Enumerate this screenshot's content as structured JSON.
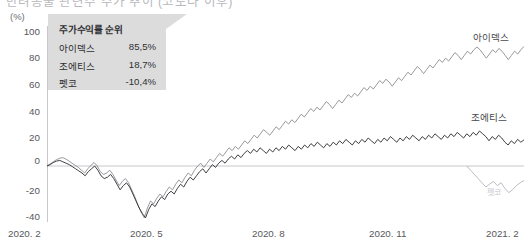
{
  "header": {
    "cut_off_title": "반려동물 관련주 주가 추이 (코로나 이후)"
  },
  "axis": {
    "unit_label": "(%)",
    "y_ticks": [
      "100",
      "80",
      "60",
      "40",
      "20",
      "0",
      "-20",
      "-40"
    ],
    "x_ticks": [
      "2020. 2",
      "2020. 5",
      "2020. 8",
      "2020. 11",
      "2021. 2"
    ]
  },
  "callout": {
    "title": "주가수익률 순위",
    "rows": [
      {
        "name": "아이덱스",
        "value": "85,5%"
      },
      {
        "name": "조에티스",
        "value": "18,7%"
      },
      {
        "name": "펫코",
        "value": "-10,4%"
      }
    ]
  },
  "series_labels": {
    "idexx": "아이덱스",
    "zoetis": "조에티스",
    "petco": "펫코"
  },
  "colors": {
    "idexx_line": "#8d8d93",
    "zoetis_line": "#2b2b30",
    "petco_line": "#b4b4ba",
    "zero_line": "#c8c8cc",
    "axis_line": "#c8c8cc",
    "callout_bg": "#dcdcdc",
    "tick_text": "#58585c"
  },
  "chart_data": {
    "type": "line",
    "xlabel": "",
    "ylabel": "(%)",
    "ylim": [
      -40,
      100
    ],
    "xlim": [
      "2020-02",
      "2021-02"
    ],
    "grid": false,
    "legend_position": "right-inline",
    "x_tick_labels": [
      "2020. 2",
      "2020. 5",
      "2020. 8",
      "2020. 11",
      "2021. 2"
    ],
    "y_tick_values": [
      100,
      80,
      60,
      40,
      20,
      0,
      -20,
      -40
    ],
    "zero_reference_line": 0,
    "annotations": [
      {
        "text": "주가수익률 순위",
        "type": "callout-title"
      },
      {
        "text": "아이덱스 85,5%",
        "type": "callout-row"
      },
      {
        "text": "조에티스 18,7%",
        "type": "callout-row"
      },
      {
        "text": "펫코 -10,4%",
        "type": "callout-row"
      }
    ],
    "series": [
      {
        "name": "아이덱스",
        "color": "#8d8d93",
        "final_value": 85.5,
        "values": [
          0,
          1.5,
          3,
          4.5,
          5.5,
          6,
          5,
          3.5,
          2,
          0.5,
          -1,
          -3,
          -5,
          -2,
          0.5,
          2.5,
          0,
          -4,
          -6,
          -5,
          -3,
          -6,
          -10,
          -14,
          -11,
          -9,
          -12,
          -17,
          -22,
          -28,
          -33,
          -37,
          -30,
          -25,
          -27,
          -23,
          -20,
          -22,
          -18,
          -15,
          -17,
          -13,
          -10,
          -12,
          -8,
          -5,
          -7,
          -3,
          0,
          2,
          -1,
          2,
          5,
          3,
          6,
          9,
          7,
          10,
          13,
          11,
          14,
          12,
          15,
          18,
          16,
          19,
          22,
          20,
          23,
          26,
          24,
          22,
          25,
          28,
          26,
          29,
          32,
          30,
          33,
          31,
          34,
          37,
          35,
          38,
          41,
          39,
          42,
          40,
          43,
          46,
          44,
          41,
          44,
          47,
          45,
          48,
          51,
          49,
          52,
          50,
          53,
          56,
          54,
          57,
          55,
          58,
          61,
          59,
          62,
          60,
          57,
          60,
          63,
          61,
          64,
          67,
          65,
          68,
          71,
          69,
          66,
          69,
          72,
          70,
          73,
          76,
          74,
          77,
          75,
          78,
          81,
          79,
          76,
          79,
          82,
          80,
          83,
          85,
          83,
          80,
          77,
          80,
          83,
          81,
          84,
          82,
          79,
          76,
          79,
          82,
          80,
          83,
          85.5
        ]
      },
      {
        "name": "조에티스",
        "color": "#2b2b30",
        "final_value": 18.7,
        "values": [
          0,
          1,
          2.5,
          3.5,
          4,
          3,
          2,
          1,
          -0.5,
          -2,
          -3.5,
          -5,
          -7,
          -4,
          -2,
          0,
          -3,
          -7,
          -9,
          -8,
          -6,
          -9,
          -13,
          -17,
          -14,
          -12,
          -15,
          -20,
          -25,
          -30,
          -34,
          -37,
          -31,
          -27,
          -29,
          -25,
          -22,
          -24,
          -20,
          -18,
          -20,
          -16,
          -13,
          -15,
          -11,
          -8,
          -10,
          -7,
          -4,
          -2,
          -5,
          -2,
          1,
          -1,
          2,
          4,
          2,
          5,
          7,
          5,
          8,
          6,
          9,
          11,
          9,
          12,
          10,
          13,
          11,
          9,
          12,
          10,
          13,
          11,
          14,
          12,
          15,
          13,
          11,
          14,
          12,
          15,
          13,
          16,
          14,
          17,
          15,
          13,
          16,
          14,
          17,
          15,
          18,
          16,
          19,
          17,
          15,
          18,
          16,
          19,
          17,
          20,
          18,
          16,
          19,
          17,
          20,
          18,
          21,
          19,
          17,
          20,
          18,
          21,
          19,
          22,
          20,
          18,
          21,
          19,
          22,
          20,
          23,
          21,
          19,
          22,
          20,
          23,
          21,
          24,
          22,
          20,
          23,
          21,
          24,
          22,
          25,
          23,
          21,
          18,
          21,
          19,
          22,
          20,
          17,
          15,
          18,
          16,
          19,
          17,
          18.7
        ]
      },
      {
        "name": "펫코",
        "color": "#b4b4ba",
        "final_value": -10.4,
        "starts_at_fraction": 0.88,
        "values": [
          0,
          -3,
          -6,
          -9,
          -12,
          -15,
          -13,
          -11,
          -14,
          -12,
          -16,
          -19,
          -17,
          -14,
          -12,
          -10.4
        ]
      }
    ]
  }
}
